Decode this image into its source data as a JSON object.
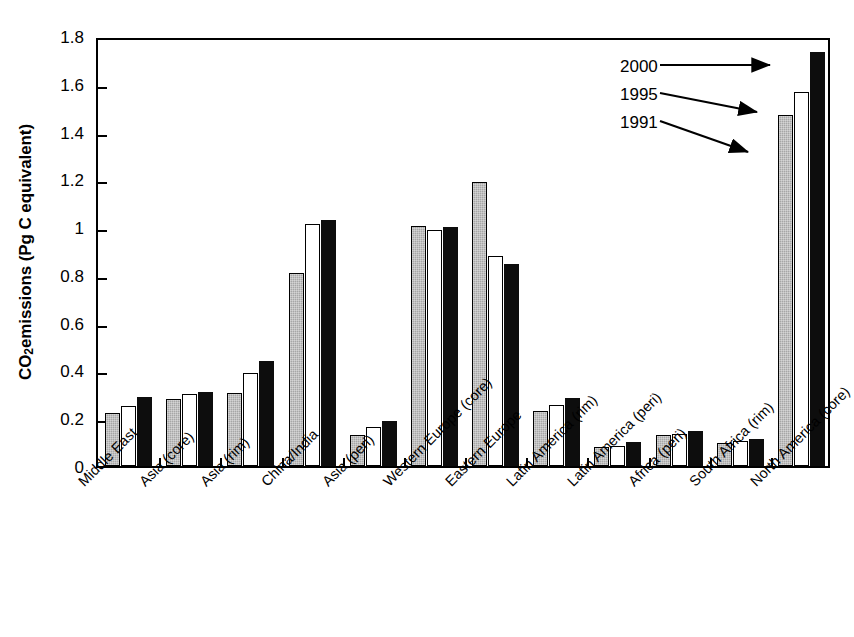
{
  "chart_data": {
    "type": "bar",
    "title": "",
    "xlabel": "",
    "ylabel": "CO2 emissions (Pg C equivalent)",
    "ylabel_parts": {
      "pre": "CO",
      "sub": "2",
      "post": " emissions (Pg C equivalent)"
    },
    "ylim": [
      0,
      1.8
    ],
    "yticks": [
      "0",
      "0.2",
      "0.4",
      "0.6",
      "0.8",
      "1",
      "1.2",
      "1.4",
      "1.6",
      "1.8"
    ],
    "ytick_values": [
      0,
      0.2,
      0.4,
      0.6,
      0.8,
      1.0,
      1.2,
      1.4,
      1.6,
      1.8
    ],
    "grid": false,
    "legend_position": "top-right-annotations",
    "categories": [
      "Middle East",
      "Asia (core)",
      "Asia (rim)",
      "China/India",
      "Asia (peri)",
      "Western Europe (core)",
      "Eastern Europe",
      "Latin America (rim)",
      "Latin America (peri)",
      "Africa (peri)",
      "South Africa (rim)",
      "North America (core)"
    ],
    "series": [
      {
        "name": "1991",
        "color": "#a6a6a6",
        "values": [
          0.22,
          0.28,
          0.305,
          0.81,
          0.13,
          1.005,
          1.19,
          0.23,
          0.08,
          0.13,
          0.095,
          1.47
        ]
      },
      {
        "name": "1995",
        "color": "#ffffff",
        "values": [
          0.25,
          0.3,
          0.39,
          1.015,
          0.165,
          0.99,
          0.88,
          0.255,
          0.085,
          0.135,
          0.105,
          1.565
        ]
      },
      {
        "name": "2000",
        "color": "#0d0d0d",
        "values": [
          0.29,
          0.31,
          0.44,
          1.03,
          0.19,
          1.0,
          0.845,
          0.285,
          0.1,
          0.145,
          0.115,
          1.735
        ]
      }
    ],
    "annotations": [
      {
        "label": "2000",
        "target_series": "2000"
      },
      {
        "label": "1995",
        "target_series": "1995"
      },
      {
        "label": "1991",
        "target_series": "1991"
      }
    ]
  }
}
